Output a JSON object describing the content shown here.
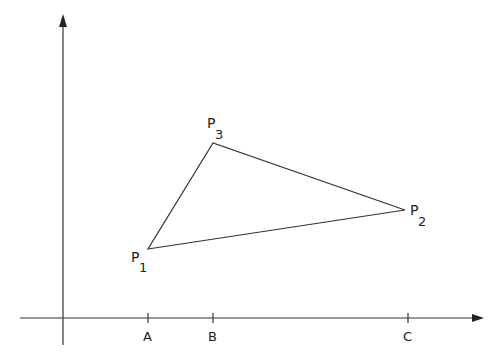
{
  "diagram": {
    "type": "triangle-on-axes",
    "colors": {
      "stroke": "#333333",
      "text": "#222222",
      "background": "#ffffff"
    },
    "axes": {
      "origin": [
        63,
        318
      ],
      "x_axis": {
        "from": [
          20,
          318
        ],
        "to": [
          483,
          318
        ]
      },
      "y_axis": {
        "from": [
          63,
          345
        ],
        "to": [
          63,
          15
        ]
      }
    },
    "ticks": [
      {
        "label": "A",
        "x": 148
      },
      {
        "label": "B",
        "x": 213
      },
      {
        "label": "C",
        "x": 408
      }
    ],
    "points": [
      {
        "name": "P",
        "sub": "1",
        "x": 148,
        "y": 249
      },
      {
        "name": "P",
        "sub": "2",
        "x": 405,
        "y": 210
      },
      {
        "name": "P",
        "sub": "3",
        "x": 213,
        "y": 143
      }
    ]
  }
}
